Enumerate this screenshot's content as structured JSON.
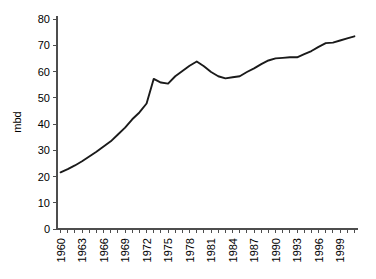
{
  "chart_data": {
    "type": "line",
    "title": "",
    "subtitle": "",
    "xlabel": "",
    "ylabel": "mbd",
    "xlim": [
      1960,
      2001
    ],
    "ylim": [
      0,
      80
    ],
    "grid": false,
    "legend": "none",
    "y_ticks": [
      0,
      10,
      20,
      30,
      40,
      50,
      60,
      70,
      80
    ],
    "y_tick_labels": [
      "0",
      "10",
      "20",
      "30",
      "40",
      "50",
      "60",
      "70",
      "80"
    ],
    "x_tick_labels": [
      "1960",
      "1963",
      "1966",
      "1969",
      "1972",
      "1975",
      "1978",
      "1981",
      "1984",
      "1987",
      "1990",
      "1993",
      "1996",
      "1999"
    ],
    "x_tick_label_step": 3,
    "x_minor_tick_count": 42,
    "series": [
      {
        "name": "World oil consumption",
        "units": "mbd",
        "x": [
          1960,
          1961,
          1962,
          1963,
          1964,
          1965,
          1966,
          1967,
          1968,
          1969,
          1970,
          1971,
          1972,
          1973,
          1974,
          1975,
          1976,
          1977,
          1978,
          1979,
          1980,
          1981,
          1982,
          1983,
          1984,
          1985,
          1986,
          1987,
          1988,
          1989,
          1990,
          1991,
          1992,
          1993,
          1994,
          1995,
          1996,
          1997,
          1998,
          1999,
          2000,
          2001
        ],
        "values": [
          21.6,
          22.8,
          24.2,
          25.8,
          27.6,
          29.4,
          31.4,
          33.4,
          36.0,
          38.6,
          41.8,
          44.4,
          47.8,
          57.2,
          55.8,
          55.4,
          58.2,
          60.2,
          62.2,
          63.8,
          62.0,
          59.8,
          58.2,
          57.4,
          57.8,
          58.2,
          59.8,
          61.2,
          62.8,
          64.2,
          65.0,
          65.2,
          65.4,
          65.4,
          66.6,
          67.8,
          69.4,
          70.8,
          71.0,
          71.8,
          72.6,
          73.4
        ]
      }
    ]
  },
  "colors": {
    "line": "#1a1a1a",
    "axis": "#4d4d4d",
    "background": "#ffffff",
    "text": "#000000"
  }
}
